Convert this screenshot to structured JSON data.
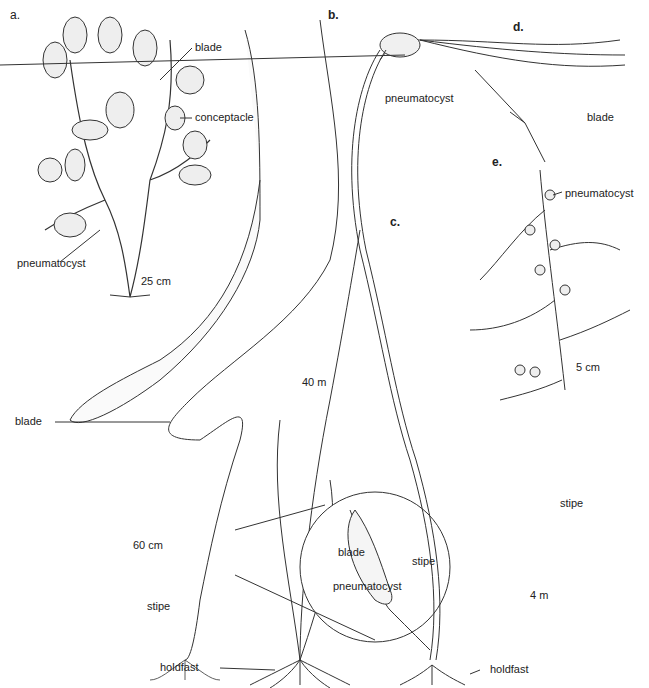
{
  "figure": {
    "panels": [
      {
        "id": "a",
        "label": "a.",
        "scale": "25 cm",
        "parts": [
          "blade",
          "conceptacle",
          "pneumatocyst"
        ]
      },
      {
        "id": "b",
        "label": "b.",
        "scale": "60 cm",
        "parts": [
          "blade",
          "stipe",
          "holdfast"
        ]
      },
      {
        "id": "c",
        "label": "c.",
        "scale": "40 m",
        "parts": [
          "blade",
          "stipe",
          "pneumatocyst",
          "holdfast"
        ]
      },
      {
        "id": "d",
        "label": "d.",
        "scale": "4 m",
        "parts": [
          "pneumatocyst",
          "blade",
          "stipe",
          "holdfast"
        ]
      },
      {
        "id": "e",
        "label": "e.",
        "scale": "5 cm",
        "parts": [
          "blade",
          "pneumatocyst"
        ]
      }
    ],
    "labels": {
      "a_blade": "blade",
      "a_conceptacle": "conceptacle",
      "a_pneumatocyst": "pneumatocyst",
      "b_blade": "blade",
      "b_stipe": "stipe",
      "holdfast_shared": "holdfast",
      "c_blade": "blade",
      "c_stipe": "stipe",
      "c_pneumatocyst": "pneumatocyst",
      "d_pneumatocyst": "pneumatocyst",
      "de_blade": "blade",
      "e_pneumatocyst": "pneumatocyst",
      "d_stipe": "stipe",
      "d_holdfast": "holdfast"
    }
  }
}
